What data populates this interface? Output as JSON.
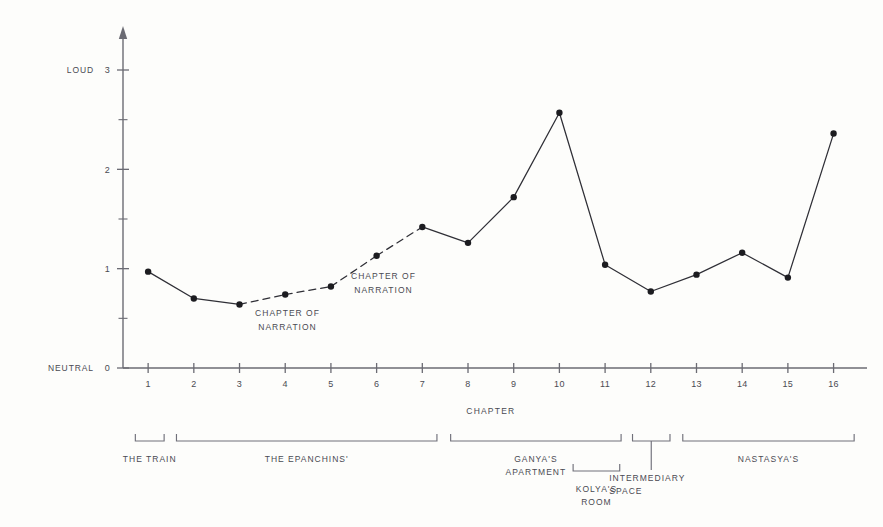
{
  "chart_data": {
    "type": "line",
    "title": "",
    "xlabel": "CHAPTER",
    "ylabel": "",
    "categories": [
      1,
      2,
      3,
      4,
      5,
      6,
      7,
      8,
      9,
      10,
      11,
      12,
      13,
      14,
      15,
      16
    ],
    "values": [
      0.97,
      0.7,
      0.64,
      0.74,
      0.82,
      1.13,
      1.42,
      1.26,
      1.72,
      2.57,
      1.04,
      0.77,
      0.94,
      1.16,
      0.91,
      2.36
    ],
    "xlim": [
      0.45,
      16.6
    ],
    "ylim": [
      0,
      3.25
    ],
    "grid": false,
    "legend": "none",
    "y_major_ticks": [
      0,
      1,
      2,
      3
    ],
    "y_minor_ticks": [
      0.5,
      1.5,
      2.5
    ],
    "y_tick_labels": [
      "0",
      "1",
      "2",
      "3"
    ],
    "y_axis_endpoint_labels": {
      "low": "NEUTRAL",
      "high": "LOUD"
    },
    "x_tick_labels": [
      "1",
      "2",
      "3",
      "4",
      "5",
      "6",
      "7",
      "8",
      "9",
      "10",
      "11",
      "12",
      "13",
      "14",
      "15",
      "16"
    ],
    "dashed_segments": [
      [
        3,
        4
      ],
      [
        4,
        5
      ],
      [
        5,
        6
      ],
      [
        6,
        7
      ]
    ],
    "series_style": {
      "line_color": "#2f2f36",
      "marker_color": "#1c1c20",
      "marker_size": 3.2
    }
  },
  "annotations": [
    {
      "id": "chapter-of-narration-1",
      "line1": "CHAPTER OF",
      "line2": "NARRATION",
      "x": 4.05,
      "y": 0.52
    },
    {
      "id": "chapter-of-narration-2",
      "line1": "CHAPTER OF",
      "line2": "NARRATION",
      "x": 6.15,
      "y": 0.9
    }
  ],
  "setting_brackets": [
    {
      "id": "the-train",
      "label_lines": [
        "THE TRAIN"
      ],
      "start": 0.72,
      "end": 1.35,
      "row": 0,
      "leader": false
    },
    {
      "id": "the-epanchins",
      "label_lines": [
        "THE EPANCHINS'"
      ],
      "start": 1.62,
      "end": 7.32,
      "row": 0,
      "leader": false
    },
    {
      "id": "ganyas-apartment",
      "label_lines": [
        "GANYA'S",
        "APARTMENT"
      ],
      "start": 7.62,
      "end": 11.35,
      "row": 0,
      "leader": false
    },
    {
      "id": "kolyas-room",
      "label_lines": [
        "KOLYA'S",
        "ROOM"
      ],
      "start": 10.3,
      "end": 11.32,
      "row": 1,
      "leader": false
    },
    {
      "id": "intermediary-space",
      "label_lines": [
        "INTERMEDIARY",
        "SPACE"
      ],
      "start": 11.6,
      "end": 12.42,
      "row": 0,
      "leader": true
    },
    {
      "id": "nastasyas",
      "label_lines": [
        "NASTASYA'S"
      ],
      "start": 12.7,
      "end": 16.45,
      "row": 0,
      "leader": false
    }
  ],
  "colors": {
    "background": "#fdfdfb",
    "ink": "#3b3b42",
    "axis": "#6b6b73",
    "line": "#2f2f36",
    "bracket": "#70707a"
  }
}
